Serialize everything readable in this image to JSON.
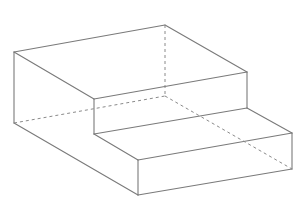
{
  "diagram": {
    "type": "3d-solid-line-drawing",
    "colors": {
      "edge": "#7a7a7a",
      "hidden_edge": "#8a8a8a",
      "background": "#ffffff"
    },
    "vertices": {
      "A_top_left_front": [
        14,
        52
      ],
      "B_top_back": [
        165,
        25
      ],
      "C_upper_step_right_top": [
        247,
        72
      ],
      "D_upper_step_inner_top": [
        94,
        99
      ],
      "E_upper_step_inner_bottom": [
        94,
        134
      ],
      "F_upper_step_right_bottom": [
        247,
        108
      ],
      "G_lower_step_right_top": [
        292,
        133
      ],
      "H_lower_step_front_top": [
        138,
        160
      ],
      "I_lower_step_front_bottom": [
        138,
        195
      ],
      "J_lower_step_right_bottom": [
        292,
        169
      ],
      "K_left_bottom": [
        14,
        123
      ],
      "L_hidden_back_bottom": [
        165,
        96
      ]
    },
    "visible_edges": [
      [
        "A_top_left_front",
        "B_top_back"
      ],
      [
        "B_top_back",
        "C_upper_step_right_top"
      ],
      [
        "A_top_left_front",
        "D_upper_step_inner_top"
      ],
      [
        "D_upper_step_inner_top",
        "C_upper_step_right_top"
      ],
      [
        "D_upper_step_inner_top",
        "E_upper_step_inner_bottom"
      ],
      [
        "C_upper_step_right_top",
        "F_upper_step_right_bottom"
      ],
      [
        "E_upper_step_inner_bottom",
        "F_upper_step_right_bottom"
      ],
      [
        "F_upper_step_right_bottom",
        "G_lower_step_right_top"
      ],
      [
        "E_upper_step_inner_bottom",
        "H_lower_step_front_top"
      ],
      [
        "H_lower_step_front_top",
        "G_lower_step_right_top"
      ],
      [
        "H_lower_step_front_top",
        "I_lower_step_front_bottom"
      ],
      [
        "G_lower_step_right_top",
        "J_lower_step_right_bottom"
      ],
      [
        "I_lower_step_front_bottom",
        "J_lower_step_right_bottom"
      ],
      [
        "A_top_left_front",
        "K_left_bottom"
      ],
      [
        "K_left_bottom",
        "I_lower_step_front_bottom"
      ]
    ],
    "hidden_edges": [
      [
        "B_top_back",
        "L_hidden_back_bottom"
      ],
      [
        "K_left_bottom",
        "L_hidden_back_bottom"
      ],
      [
        "L_hidden_back_bottom",
        "J_lower_step_right_bottom"
      ]
    ]
  }
}
